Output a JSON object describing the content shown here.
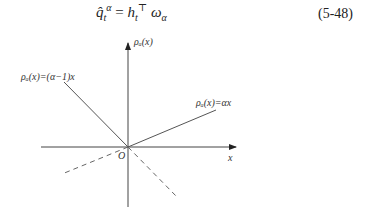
{
  "equation": {
    "lhs_base": "q̂",
    "lhs_sub": "t",
    "lhs_sup": "α",
    "equals": "=",
    "rhs_h": "h",
    "rhs_h_sub": "t",
    "rhs_transpose": "⊤",
    "rhs_omega": "ω",
    "rhs_omega_sub": "α",
    "number": "(5-48)"
  },
  "figure": {
    "y_axis_label": "ρₐ(x)",
    "x_axis_label": "x",
    "origin_label": "O",
    "left_line_label": "ρₐ(x)=(α−1)x",
    "right_line_label": "ρₐ(x)=αx",
    "colors": {
      "axis": "#444444",
      "line": "#555555",
      "dashed": "#666666"
    }
  }
}
